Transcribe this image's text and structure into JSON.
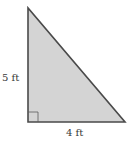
{
  "diagram": {
    "type": "right-triangle",
    "fill_color": "#d4d4d4",
    "stroke_color": "#4a4a4a",
    "labels": {
      "vertical_leg": "5 ft",
      "horizontal_leg": "4 ft"
    },
    "right_angle_marker": true
  }
}
